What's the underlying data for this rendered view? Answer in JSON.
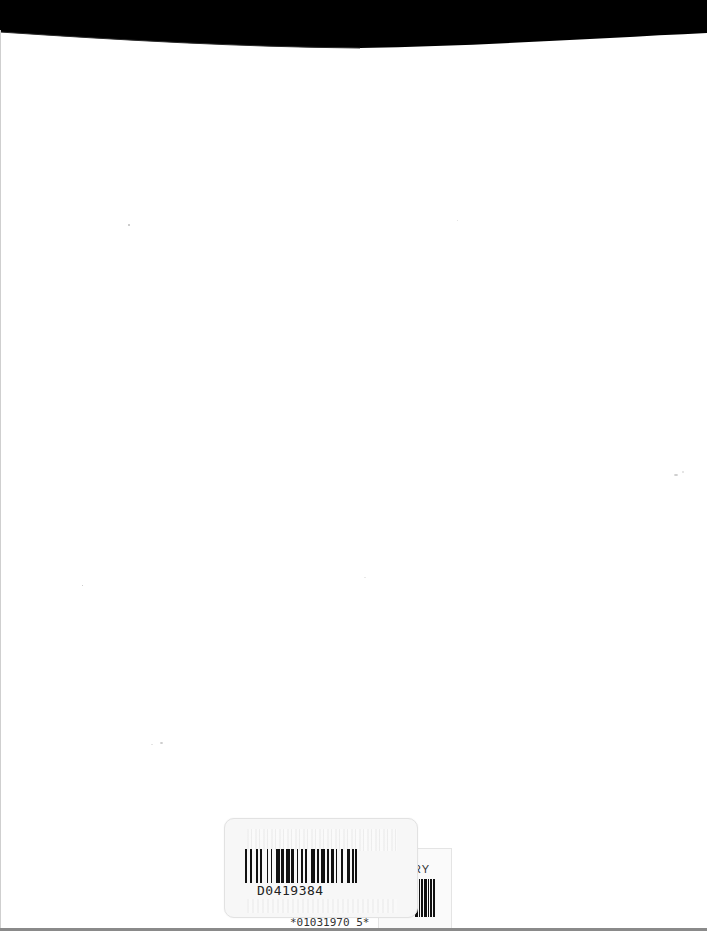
{
  "page": {
    "type": "scanned blank page",
    "background_color": "#ffffff",
    "top_edge_color": "#000000"
  },
  "barcode_label": {
    "barcode_number": "D0419384",
    "secondary_label_text": "RY",
    "call_number_partial": "*01031970 5*"
  }
}
